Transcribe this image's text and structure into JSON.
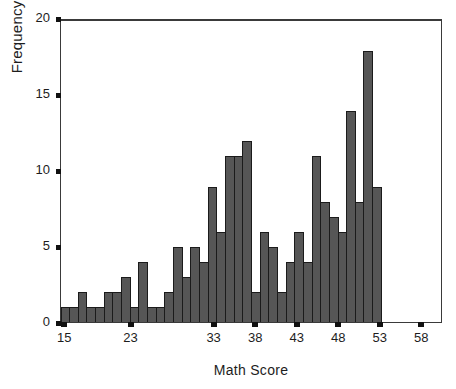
{
  "chart_data": {
    "type": "bar",
    "title": "",
    "xlabel": "Math Score",
    "ylabel": "Frequency",
    "ylim": [
      0,
      20
    ],
    "yticks": [
      0,
      5,
      10,
      15,
      20
    ],
    "ytick_labels": [
      "0",
      "5",
      "10",
      "15",
      "20"
    ],
    "xticks": [
      15,
      23,
      33,
      38,
      43,
      48,
      53,
      58
    ],
    "xtick_labels": [
      "15",
      "23",
      "33",
      "38",
      "43",
      "48",
      "53",
      "58"
    ],
    "xlim": [
      14,
      61
    ],
    "grid": false,
    "legend": null,
    "bar_color": "#565656",
    "bar_edge_color": "#1b1b1b",
    "categories": [
      "15",
      "16",
      "17",
      "18",
      "19",
      "20",
      "21",
      "22",
      "23",
      "24",
      "25",
      "26",
      "27",
      "28",
      "29",
      "30",
      "31",
      "32",
      "33",
      "34",
      "35",
      "36",
      "37",
      "38",
      "39",
      "40",
      "41",
      "42",
      "43",
      "44",
      "45",
      "46",
      "47",
      "48",
      "49",
      "50",
      "51",
      "52",
      "53",
      "54",
      "55",
      "56",
      "57",
      "58",
      "59",
      "60"
    ],
    "values": [
      1,
      1,
      2,
      1,
      1,
      2,
      2,
      3,
      1,
      4,
      1,
      1,
      2,
      5,
      3,
      5,
      4,
      9,
      6,
      11,
      11,
      12,
      2,
      6,
      5,
      2,
      4,
      6,
      4,
      11,
      8,
      7,
      6,
      14,
      8,
      18,
      9,
      0,
      0,
      0,
      0,
      0,
      0,
      0,
      0,
      0
    ]
  },
  "axes": {
    "y_title": "Frequency",
    "x_title": "Math Score"
  }
}
